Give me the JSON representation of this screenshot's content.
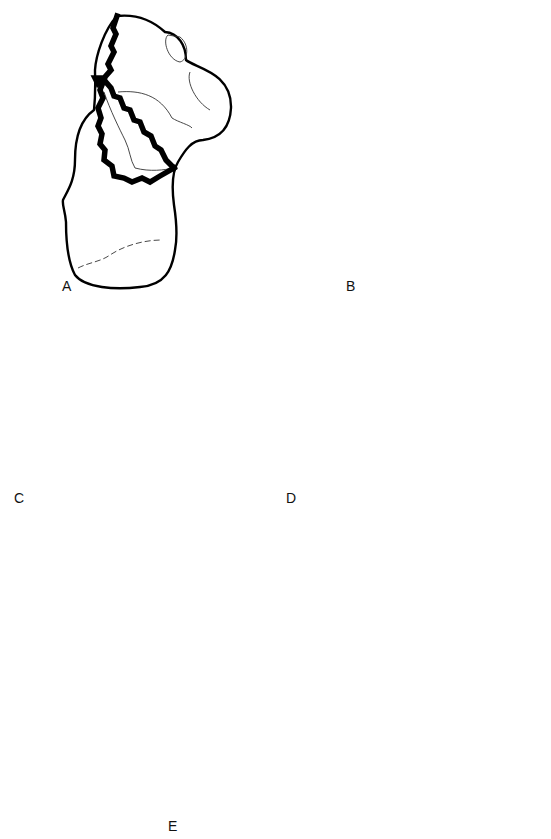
{
  "figure": {
    "panels": [
      {
        "id": "A",
        "label": "A",
        "view": "bone view with triangular fracture fragment"
      },
      {
        "id": "B",
        "label": "B",
        "view": "bone view with quadrilateral fracture fragment"
      },
      {
        "id": "C",
        "label": "C",
        "view": "lateral view with branching fracture lines"
      },
      {
        "id": "D",
        "label": "D",
        "view": "medial view with T-shaped fracture lines"
      },
      {
        "id": "E",
        "label": "E",
        "view": "sectioned view with rectangular fracture fragment"
      }
    ],
    "colors": {
      "background": "#ffffff",
      "outline": "#000000",
      "fracture_line": "#000000"
    }
  }
}
